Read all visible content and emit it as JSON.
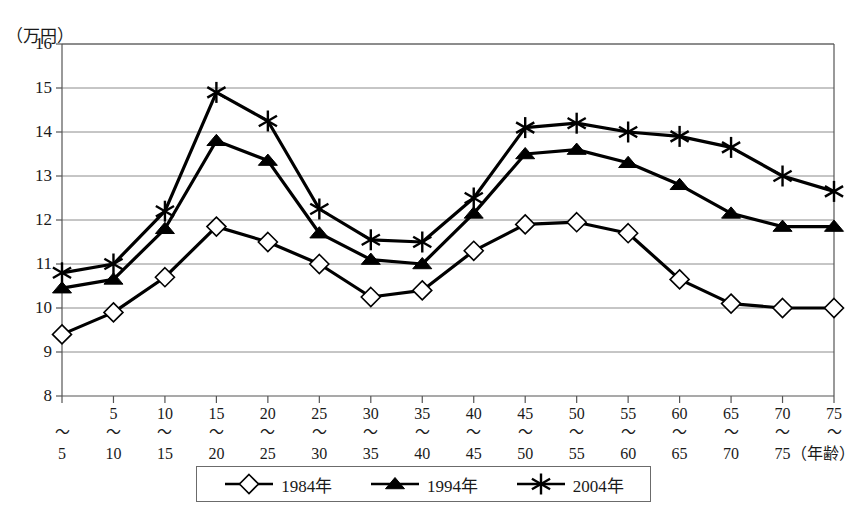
{
  "chart_data": {
    "type": "line",
    "title": "",
    "xlabel": "（年齢）",
    "ylabel": "（万円）",
    "ylim": [
      8,
      16
    ],
    "yticks": [
      8,
      9,
      10,
      11,
      12,
      13,
      14,
      15,
      16
    ],
    "ytick_labels": [
      "8",
      "9",
      "10",
      "11",
      "12",
      "13",
      "14",
      "15",
      "16"
    ],
    "grid": true,
    "legend_position": "bottom",
    "categories": [
      "〜5",
      "5〜10",
      "10〜15",
      "15〜20",
      "20〜25",
      "25〜30",
      "30〜35",
      "35〜40",
      "40〜45",
      "45〜50",
      "50〜55",
      "55〜60",
      "60〜65",
      "65〜70",
      "70〜75",
      "75〜"
    ],
    "category_parts": [
      {
        "top": "",
        "tilde": "〜",
        "bottom": "5"
      },
      {
        "top": "5",
        "tilde": "〜",
        "bottom": "10"
      },
      {
        "top": "10",
        "tilde": "〜",
        "bottom": "15"
      },
      {
        "top": "15",
        "tilde": "〜",
        "bottom": "20"
      },
      {
        "top": "20",
        "tilde": "〜",
        "bottom": "25"
      },
      {
        "top": "25",
        "tilde": "〜",
        "bottom": "30"
      },
      {
        "top": "30",
        "tilde": "〜",
        "bottom": "35"
      },
      {
        "top": "35",
        "tilde": "〜",
        "bottom": "40"
      },
      {
        "top": "40",
        "tilde": "〜",
        "bottom": "45"
      },
      {
        "top": "45",
        "tilde": "〜",
        "bottom": "50"
      },
      {
        "top": "50",
        "tilde": "〜",
        "bottom": "55"
      },
      {
        "top": "55",
        "tilde": "〜",
        "bottom": "60"
      },
      {
        "top": "60",
        "tilde": "〜",
        "bottom": "65"
      },
      {
        "top": "65",
        "tilde": "〜",
        "bottom": "70"
      },
      {
        "top": "70",
        "tilde": "〜",
        "bottom": "75"
      },
      {
        "top": "75",
        "tilde": "〜",
        "bottom": ""
      }
    ],
    "series": [
      {
        "name": "1984年",
        "marker": "open-diamond",
        "color": "#000000",
        "values": [
          9.4,
          9.9,
          10.7,
          11.85,
          11.5,
          11.0,
          10.25,
          10.4,
          11.3,
          11.9,
          11.95,
          11.7,
          10.65,
          10.1,
          10.0,
          10.0
        ]
      },
      {
        "name": "1994年",
        "marker": "filled-triangle",
        "color": "#000000",
        "values": [
          10.45,
          10.65,
          11.8,
          13.8,
          13.35,
          11.7,
          11.1,
          11.0,
          12.15,
          13.5,
          13.6,
          13.3,
          12.8,
          12.15,
          11.85,
          11.85
        ]
      },
      {
        "name": "2004年",
        "marker": "asterisk",
        "color": "#000000",
        "values": [
          10.8,
          11.0,
          12.2,
          14.9,
          14.25,
          12.25,
          11.55,
          11.5,
          12.5,
          14.1,
          14.2,
          14.0,
          13.9,
          13.65,
          13.0,
          12.65
        ]
      }
    ]
  },
  "legend": {
    "entries": [
      {
        "label": "1984年",
        "marker": "open-diamond"
      },
      {
        "label": "1994年",
        "marker": "filled-triangle"
      },
      {
        "label": "2004年",
        "marker": "asterisk"
      }
    ]
  },
  "colors": {
    "line": "#000000",
    "frame": "#555555",
    "grid": "#8c8c8c",
    "background": "#ffffff",
    "marker_fill": "#ffffff"
  }
}
